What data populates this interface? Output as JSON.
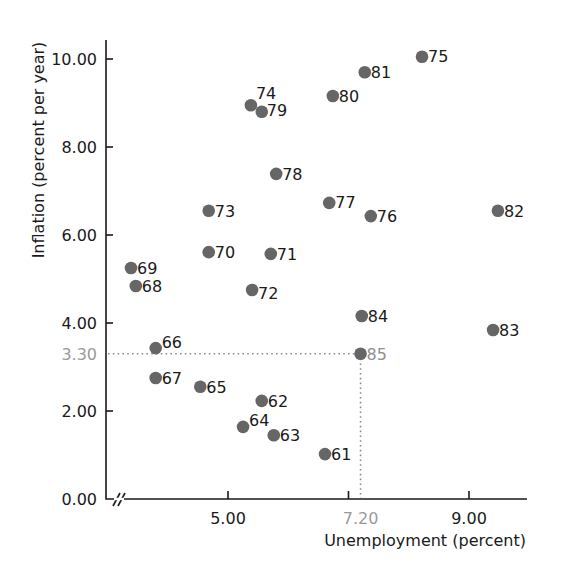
{
  "chart_data": {
    "type": "scatter",
    "title": "",
    "xlabel": "Unemployment (percent)",
    "ylabel": "Inflation (percent per year)",
    "xlim": [
      3.0,
      9.75
    ],
    "ylim": [
      0,
      10.4
    ],
    "x_axis_break": true,
    "grid": false,
    "legend": "none",
    "x_ticks": [
      {
        "value": 5.0,
        "label": "5.00",
        "highlight": false,
        "tick": true
      },
      {
        "value": 7.0,
        "label": "",
        "highlight": false,
        "tick": true
      },
      {
        "value": 7.2,
        "label": "7.20",
        "highlight": true,
        "tick": false
      },
      {
        "value": 9.0,
        "label": "9.00",
        "highlight": false,
        "tick": true
      }
    ],
    "y_ticks": [
      {
        "value": 0.0,
        "label": "0.00",
        "highlight": false,
        "tick": false
      },
      {
        "value": 2.0,
        "label": "2.00",
        "highlight": false,
        "tick": true
      },
      {
        "value": 3.3,
        "label": "3.30",
        "highlight": true,
        "tick": false
      },
      {
        "value": 4.0,
        "label": "4.00",
        "highlight": false,
        "tick": true
      },
      {
        "value": 6.0,
        "label": "6.00",
        "highlight": false,
        "tick": true
      },
      {
        "value": 8.0,
        "label": "8.00",
        "highlight": false,
        "tick": true
      },
      {
        "value": 10.0,
        "label": "10.00",
        "highlight": false,
        "tick": true
      }
    ],
    "annotations": [
      {
        "type": "dotted-guide",
        "from_point": "85",
        "x": 7.2,
        "y": 3.3,
        "text": "Guide lines from point 85 to both axes"
      }
    ],
    "points": [
      {
        "label": "61",
        "x": 6.61,
        "y": 1.02,
        "highlight": false,
        "label_dx": 6,
        "label_dy": 6
      },
      {
        "label": "62",
        "x": 5.56,
        "y": 2.23,
        "highlight": false,
        "label_dx": 6,
        "label_dy": 6
      },
      {
        "label": "63",
        "x": 5.76,
        "y": 1.45,
        "highlight": false,
        "label_dx": 6,
        "label_dy": 6
      },
      {
        "label": "64",
        "x": 5.25,
        "y": 1.64,
        "highlight": false,
        "label_dx": 6,
        "label_dy": -1
      },
      {
        "label": "65",
        "x": 4.54,
        "y": 2.55,
        "highlight": false,
        "label_dx": 6,
        "label_dy": 6
      },
      {
        "label": "66",
        "x": 3.8,
        "y": 3.43,
        "highlight": false,
        "label_dx": 6,
        "label_dy": 0
      },
      {
        "label": "67",
        "x": 3.8,
        "y": 2.75,
        "highlight": false,
        "label_dx": 6,
        "label_dy": 6
      },
      {
        "label": "68",
        "x": 3.47,
        "y": 4.84,
        "highlight": false,
        "label_dx": 6,
        "label_dy": 6
      },
      {
        "label": "69",
        "x": 3.39,
        "y": 5.25,
        "highlight": false,
        "label_dx": 6,
        "label_dy": 6
      },
      {
        "label": "70",
        "x": 4.68,
        "y": 5.61,
        "highlight": false,
        "label_dx": 6,
        "label_dy": 6
      },
      {
        "label": "71",
        "x": 5.71,
        "y": 5.57,
        "highlight": false,
        "label_dx": 6,
        "label_dy": 6
      },
      {
        "label": "72",
        "x": 5.4,
        "y": 4.75,
        "highlight": false,
        "label_dx": 6,
        "label_dy": 9
      },
      {
        "label": "73",
        "x": 4.68,
        "y": 6.55,
        "highlight": false,
        "label_dx": 6,
        "label_dy": 6
      },
      {
        "label": "74",
        "x": 5.38,
        "y": 8.95,
        "highlight": false,
        "label_dx": 5,
        "label_dy": -6
      },
      {
        "label": "75",
        "x": 8.22,
        "y": 10.05,
        "highlight": false,
        "label_dx": 6,
        "label_dy": 5
      },
      {
        "label": "76",
        "x": 7.37,
        "y": 6.43,
        "highlight": false,
        "label_dx": 6,
        "label_dy": 6
      },
      {
        "label": "77",
        "x": 6.68,
        "y": 6.73,
        "highlight": false,
        "label_dx": 6,
        "label_dy": 5
      },
      {
        "label": "78",
        "x": 5.8,
        "y": 7.39,
        "highlight": false,
        "label_dx": 6,
        "label_dy": 6
      },
      {
        "label": "79",
        "x": 5.56,
        "y": 8.8,
        "highlight": false,
        "label_dx": 5,
        "label_dy": 4
      },
      {
        "label": "80",
        "x": 6.74,
        "y": 9.16,
        "highlight": false,
        "label_dx": 6,
        "label_dy": 6
      },
      {
        "label": "81",
        "x": 7.27,
        "y": 9.7,
        "highlight": false,
        "label_dx": 6,
        "label_dy": 6
      },
      {
        "label": "82",
        "x": 9.48,
        "y": 6.55,
        "highlight": false,
        "label_dx": 6,
        "label_dy": 6
      },
      {
        "label": "83",
        "x": 9.4,
        "y": 3.84,
        "highlight": false,
        "label_dx": 6,
        "label_dy": 6
      },
      {
        "label": "84",
        "x": 7.22,
        "y": 4.16,
        "highlight": false,
        "label_dx": 6,
        "label_dy": 6
      },
      {
        "label": "85",
        "x": 7.2,
        "y": 3.3,
        "highlight": true,
        "label_dx": 6,
        "label_dy": 6
      }
    ]
  },
  "colors": {
    "dot": "#666666",
    "axis": "#1a1a1a",
    "text": "#1a1a1a",
    "highlight_text": "#9a9a9a",
    "guide": "#8a8a8a"
  }
}
